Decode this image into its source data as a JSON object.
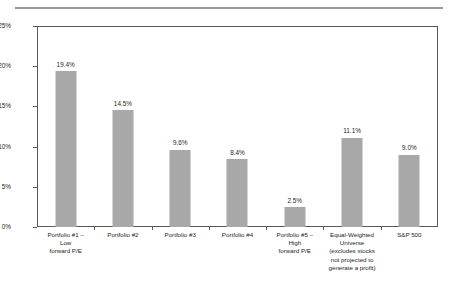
{
  "chart_data": {
    "type": "bar",
    "title": "",
    "subtitle": "",
    "xlabel": "",
    "ylabel": "",
    "ylim": [
      0,
      25
    ],
    "grid": false,
    "legend": false,
    "y_tick_labels": [
      "0%",
      "5%",
      "10%",
      "15%",
      "20%",
      "25%"
    ],
    "y_tick_values": [
      0,
      5,
      10,
      15,
      20,
      25
    ],
    "categories": [
      "Portfolio #1 – Low forward P/E",
      "Portfolio #2",
      "Portfolio #3",
      "Portfolio #4",
      "Portfolio #5 – High forward P/E",
      "Equal-Weighted Universe (excludes stocks not projected to generate a profit)",
      "S&P 500"
    ],
    "category_lines": [
      [
        "Portfolio #1 –",
        "Low",
        "forward P/E"
      ],
      [
        "Portfolio #2"
      ],
      [
        "Portfolio #3"
      ],
      [
        "Portfolio #4"
      ],
      [
        "Portfolio #5 –",
        "High",
        "forward P/E"
      ],
      [
        "Equal-Weighted",
        "Universe",
        "(excludes stocks",
        "not projected to",
        "generate a profit)"
      ],
      [
        "S&P 500"
      ]
    ],
    "values": [
      19.4,
      14.5,
      9.6,
      8.4,
      2.5,
      11.1,
      9.0
    ],
    "value_labels": [
      "19.4%",
      "14.5%",
      "9.6%",
      "8.4%",
      "2.5%",
      "11.1%",
      "9.0%"
    ],
    "bar_color": "#a8a8a8",
    "axis_color": "#58595b",
    "text_color": "#231f20",
    "background_color": "#ffffff",
    "rule_color": "#9a9a9a"
  }
}
